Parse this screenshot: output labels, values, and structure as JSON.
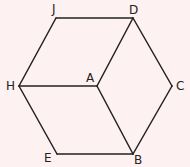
{
  "diagram": {
    "title": "",
    "background_color": "#fdf1f2",
    "line_color": "#222222",
    "vertices": [
      {
        "id": "J",
        "label": "J",
        "x": 56,
        "y": 18,
        "lx": 52,
        "ly": 13
      },
      {
        "id": "D",
        "label": "D",
        "x": 133,
        "y": 18,
        "lx": 133,
        "ly": 14
      },
      {
        "id": "H",
        "label": "H",
        "x": 19,
        "y": 86,
        "lx": 10,
        "ly": 90
      },
      {
        "id": "A",
        "label": "A",
        "x": 97,
        "y": 86,
        "lx": 89,
        "ly": 81
      },
      {
        "id": "C",
        "label": "C",
        "x": 172,
        "y": 86,
        "lx": 179,
        "ly": 90
      },
      {
        "id": "E",
        "label": "E",
        "x": 57,
        "y": 154,
        "lx": 48,
        "ly": 161
      },
      {
        "id": "B",
        "label": "B",
        "x": 133,
        "y": 154,
        "lx": 139,
        "ly": 163
      }
    ],
    "edges": [
      [
        "J",
        "D"
      ],
      [
        "J",
        "H"
      ],
      [
        "D",
        "A"
      ],
      [
        "D",
        "C"
      ],
      [
        "H",
        "A"
      ],
      [
        "H",
        "E"
      ],
      [
        "A",
        "B"
      ],
      [
        "C",
        "B"
      ],
      [
        "E",
        "B"
      ]
    ]
  }
}
